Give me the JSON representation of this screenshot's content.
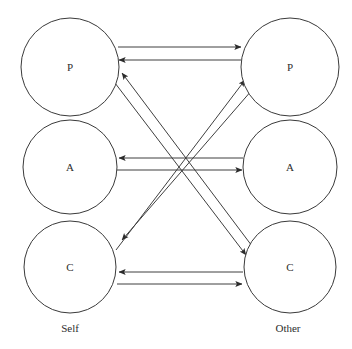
{
  "figure": {
    "type": "diagram",
    "subtype": "transactional-analysis-ego-state-diagram",
    "background_color": "#ffffff",
    "line_color": "#3f3f3f",
    "arrow_color": "#2b2b2b",
    "circle_stroke_color": "#3a3a3a",
    "text_color": "#2e2e2e",
    "width": 352,
    "height": 349
  },
  "columns": [
    {
      "id": "self",
      "label": "Self",
      "label_x": 70,
      "label_y": 332,
      "center_x": 70
    },
    {
      "id": "other",
      "label": "Other",
      "label_x": 288,
      "label_y": 332,
      "center_x": 290
    }
  ],
  "nodes": [
    {
      "id": "self-p",
      "label": "P",
      "column": "self",
      "cx": 70,
      "cy": 67,
      "r": 49
    },
    {
      "id": "self-a",
      "label": "A",
      "column": "self",
      "cx": 70,
      "cy": 167,
      "r": 47
    },
    {
      "id": "self-c",
      "label": "C",
      "column": "self",
      "cx": 70,
      "cy": 267,
      "r": 46
    },
    {
      "id": "other-p",
      "label": "P",
      "column": "other",
      "cx": 290,
      "cy": 67,
      "r": 49
    },
    {
      "id": "other-a",
      "label": "A",
      "column": "other",
      "cx": 290,
      "cy": 167,
      "r": 47
    },
    {
      "id": "other-c",
      "label": "C",
      "column": "other",
      "cx": 290,
      "cy": 267,
      "r": 46
    }
  ],
  "edges": [
    {
      "id": "edge-self-p-to-other-p",
      "from": "self-p",
      "to": "other-p",
      "x1": 118,
      "y1": 47,
      "x2": 241,
      "y2": 47,
      "kind": "horizontal",
      "direction": "right"
    },
    {
      "id": "edge-other-p-to-self-p",
      "from": "other-p",
      "to": "self-p",
      "x1": 241,
      "y1": 60,
      "x2": 119,
      "y2": 60,
      "kind": "horizontal",
      "direction": "left"
    },
    {
      "id": "edge-other-a-to-self-a",
      "from": "other-a",
      "to": "self-a",
      "x1": 243,
      "y1": 158,
      "x2": 119,
      "y2": 158,
      "kind": "horizontal",
      "direction": "left"
    },
    {
      "id": "edge-self-a-to-other-a",
      "from": "self-a",
      "to": "other-a",
      "x1": 117,
      "y1": 170,
      "x2": 242,
      "y2": 170,
      "kind": "horizontal",
      "direction": "right"
    },
    {
      "id": "edge-other-c-to-self-c",
      "from": "other-c",
      "to": "self-c",
      "x1": 243,
      "y1": 272,
      "x2": 119,
      "y2": 272,
      "kind": "horizontal",
      "direction": "left"
    },
    {
      "id": "edge-self-c-to-other-c",
      "from": "self-c",
      "to": "other-c",
      "x1": 117,
      "y1": 284,
      "x2": 242,
      "y2": 284,
      "kind": "horizontal",
      "direction": "right"
    },
    {
      "id": "edge-self-p-to-other-c",
      "from": "self-p",
      "to": "other-c",
      "x1": 115,
      "y1": 83,
      "x2": 246,
      "y2": 255,
      "kind": "diagonal",
      "direction": "down-right"
    },
    {
      "id": "edge-other-c-to-self-p",
      "from": "other-c",
      "to": "self-p",
      "x1": 252,
      "y1": 246,
      "x2": 122,
      "y2": 73,
      "kind": "diagonal",
      "direction": "up-left"
    },
    {
      "id": "edge-self-c-to-other-p",
      "from": "self-c",
      "to": "other-p",
      "x1": 116,
      "y1": 250,
      "x2": 245,
      "y2": 80,
      "kind": "diagonal",
      "direction": "up-right"
    },
    {
      "id": "edge-other-p-to-self-c",
      "from": "other-p",
      "to": "self-c",
      "x1": 252,
      "y1": 90,
      "x2": 122,
      "y2": 240,
      "kind": "diagonal",
      "direction": "down-left"
    }
  ]
}
